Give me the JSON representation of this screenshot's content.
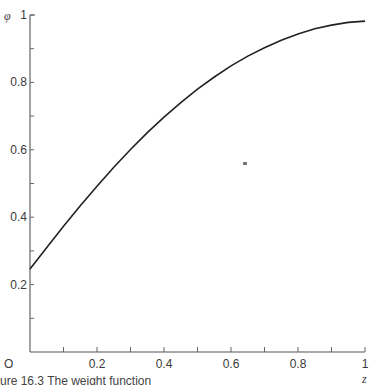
{
  "chart_data": {
    "type": "line",
    "title": "",
    "xlabel": "z",
    "ylabel": "φ",
    "xlim": [
      0,
      1
    ],
    "ylim": [
      0,
      1
    ],
    "grid": false,
    "legend": null,
    "x_ticks_major": [
      0.2,
      0.4,
      0.6,
      0.8,
      1
    ],
    "x_tick_labels": [
      "0.2",
      "0.4",
      "0.6",
      "0.8",
      "1"
    ],
    "x_ticks_minor": [
      0.1,
      0.3,
      0.5,
      0.7,
      0.9
    ],
    "y_ticks_major": [
      0.2,
      0.4,
      0.6,
      0.8,
      1
    ],
    "y_tick_labels": [
      "0.2",
      "0.4",
      "0.6",
      "0.8",
      "1"
    ],
    "y_ticks_minor": [
      0.1,
      0.3,
      0.5,
      0.7,
      0.9
    ],
    "origin_label": "O",
    "series": [
      {
        "name": "φ(z)",
        "x": [
          0,
          0.05,
          0.1,
          0.15,
          0.2,
          0.25,
          0.3,
          0.35,
          0.4,
          0.45,
          0.5,
          0.55,
          0.6,
          0.65,
          0.7,
          0.75,
          0.8,
          0.85,
          0.9,
          0.95,
          1.0
        ],
        "values": [
          0.246,
          0.31,
          0.373,
          0.434,
          0.492,
          0.548,
          0.601,
          0.651,
          0.697,
          0.74,
          0.78,
          0.816,
          0.849,
          0.878,
          0.903,
          0.925,
          0.944,
          0.959,
          0.97,
          0.978,
          0.982
        ]
      }
    ],
    "caption": "ure 16.3  The weight function"
  }
}
